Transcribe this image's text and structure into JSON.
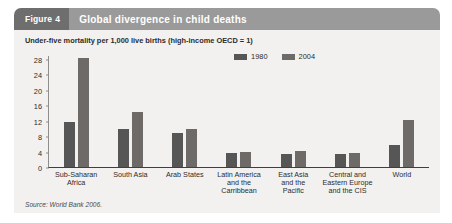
{
  "figure": {
    "tag_label": "Figure",
    "tag_number": "4",
    "title": "Global divergence in child deaths",
    "subtitle": "Under-five mortality per 1,000 live births (high-income OECD = 1)",
    "source": "Source: World Bank 2006."
  },
  "colors": {
    "tag_background": "#6e6e6e",
    "title_background": "#9a9a9a",
    "panel_background": "#f2f1ef",
    "series_1980": "#565656",
    "series_2004": "#6d6a67",
    "axis": "#8d8d8d",
    "baseline": "#3f3f3f",
    "text": "#2c2c2c"
  },
  "chart_data": {
    "type": "bar",
    "title": "Global divergence in child deaths",
    "subtitle": "Under-five mortality per 1,000 live births (high-income OECD = 1)",
    "xlabel": "",
    "ylabel": "",
    "ylim": [
      0,
      29
    ],
    "yticks": [
      0,
      4,
      8,
      12,
      16,
      20,
      24,
      28
    ],
    "grid": false,
    "legend_position": "top-right",
    "categories": [
      "Sub-Saharan\nAfrica",
      "South Asia",
      "Arab States",
      "Latin America\nand the\nCarribbean",
      "East Asia\nand the\nPacific",
      "Central and\nEastern Europe\nand the CIS",
      "World"
    ],
    "series": [
      {
        "name": "1980",
        "values": [
          12,
          10,
          9,
          4,
          3.5,
          3.5,
          6
        ]
      },
      {
        "name": "2004",
        "values": [
          28.5,
          14.5,
          10,
          4.2,
          4.5,
          4,
          12.5
        ]
      }
    ]
  }
}
